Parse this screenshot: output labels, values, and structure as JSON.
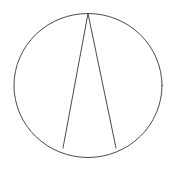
{
  "canvas": {
    "width": 175,
    "height": 169,
    "background_color": "#ffffff",
    "stroke_color": "#4a4a4a",
    "stroke_width": 1
  },
  "figure": {
    "name": "circle-with-inscribed-narrow-triangle",
    "description": "A circle with two straight chords drawn from the top of the circle down to two points on the lower arc, forming a narrow open triangle",
    "title": "",
    "label": ""
  },
  "shapes": {
    "circle": {
      "name": "circle",
      "center_x": 88,
      "center_y": 85.5,
      "radius_x": 74,
      "radius_y": 72,
      "stroke_color": "#4a4a4a",
      "fill": "none"
    },
    "chord_left": {
      "name": "left-chord",
      "x1": 88,
      "y1": 13.5,
      "x2": 63,
      "y2": 148,
      "stroke_color": "#4a4a4a"
    },
    "chord_right": {
      "name": "right-chord",
      "x1": 88,
      "y1": 13.5,
      "x2": 116,
      "y2": 148,
      "stroke_color": "#4a4a4a"
    }
  },
  "chart_data": {
    "type": "scatter",
    "title": "",
    "xlabel": "",
    "ylabel": "",
    "grid": false,
    "legend": "none",
    "xlim": [
      0,
      175
    ],
    "ylim": [
      0,
      169
    ],
    "annotations": [
      "circle outline",
      "apex vertex at top of circle",
      "left base vertex on lower-left arc",
      "right base vertex on lower-right arc"
    ],
    "points": [
      {
        "name": "apex",
        "x": 88,
        "y": 13.5
      },
      {
        "name": "base-left",
        "x": 63,
        "y": 148
      },
      {
        "name": "base-right",
        "x": 116,
        "y": 148
      },
      {
        "name": "circle-center",
        "x": 88,
        "y": 85.5
      },
      {
        "name": "circle-left",
        "x": 14,
        "y": 85.5
      },
      {
        "name": "circle-right",
        "x": 162,
        "y": 85.5
      },
      {
        "name": "circle-top",
        "x": 88,
        "y": 13.5
      },
      {
        "name": "circle-bottom",
        "x": 88,
        "y": 157.5
      }
    ]
  }
}
